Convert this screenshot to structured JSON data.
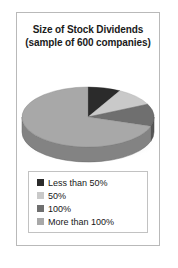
{
  "figure": {
    "title_line1": "Size of Stock Dividends",
    "title_line2": "(sample of 600 companies)"
  },
  "chart_data": {
    "type": "pie",
    "title": "Size of Stock Dividends (sample of 600 companies)",
    "subtitle": "sample of 600 companies",
    "sample_size": 600,
    "three_d": true,
    "legend_position": "bottom",
    "grid": false,
    "xlabel": "",
    "ylabel": "",
    "categories": [
      "Less than 50%",
      "50%",
      "100%",
      "More than 100%"
    ],
    "values": [
      8,
      10,
      12,
      70
    ],
    "value_unit": "percent",
    "colors": [
      "#2b2b2b",
      "#c9c9c9",
      "#6f6f6f",
      "#a8a8a8"
    ],
    "slices": [
      {
        "label": "Less than 50%",
        "value": 8,
        "color": "#2b2b2b"
      },
      {
        "label": "50%",
        "value": 10,
        "color": "#c9c9c9"
      },
      {
        "label": "100%",
        "value": 12,
        "color": "#6f6f6f"
      },
      {
        "label": "More than 100%",
        "value": 70,
        "color": "#a8a8a8"
      }
    ]
  },
  "legend": {
    "items": [
      {
        "label": "Less than 50%",
        "color": "#2b2b2b"
      },
      {
        "label": "50%",
        "color": "#c9c9c9"
      },
      {
        "label": "100%",
        "color": "#6f6f6f"
      },
      {
        "label": "More than 100%",
        "color": "#a8a8a8"
      }
    ]
  }
}
